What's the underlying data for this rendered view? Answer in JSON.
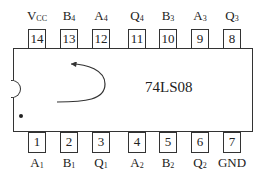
{
  "chip": {
    "part_number": "74LS08",
    "description": "Quad 2-input AND gate DIP-14 pinout"
  },
  "top_pins": [
    {
      "number": "14",
      "label": "V",
      "sub": "CC",
      "x": 28
    },
    {
      "number": "13",
      "label": "B",
      "sub": "4",
      "x": 60
    },
    {
      "number": "12",
      "label": "A",
      "sub": "4",
      "x": 92
    },
    {
      "number": "11",
      "label": "Q",
      "sub": "4",
      "x": 128
    },
    {
      "number": "10",
      "label": "B",
      "sub": "3",
      "x": 159
    },
    {
      "number": "9",
      "label": "A",
      "sub": "3",
      "x": 191
    },
    {
      "number": "8",
      "label": "Q",
      "sub": "3",
      "x": 223
    }
  ],
  "bottom_pins": [
    {
      "number": "1",
      "label": "A",
      "sub": "1",
      "x": 28
    },
    {
      "number": "2",
      "label": "B",
      "sub": "1",
      "x": 60
    },
    {
      "number": "3",
      "label": "Q",
      "sub": "1",
      "x": 92
    },
    {
      "number": "4",
      "label": "A",
      "sub": "2",
      "x": 128
    },
    {
      "number": "5",
      "label": "B",
      "sub": "2",
      "x": 159
    },
    {
      "number": "6",
      "label": "Q",
      "sub": "2",
      "x": 191
    },
    {
      "number": "7",
      "label": "GND",
      "sub": "",
      "x": 223
    }
  ]
}
